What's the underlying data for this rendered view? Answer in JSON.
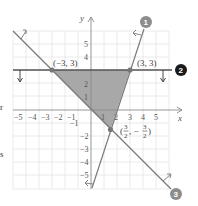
{
  "figure": {
    "type": "system-of-linear-inequalities-graph",
    "axes": {
      "x_label": "x",
      "y_label": "y",
      "x_ticks": [
        "−5",
        "−4",
        "−3",
        "−2",
        "−1",
        "1",
        "2",
        "3",
        "4",
        "5"
      ],
      "y_ticks_pos": [
        "1",
        "2",
        "4",
        "5"
      ],
      "y_ticks_neg": [
        "−1",
        "−2",
        "−3",
        "−4",
        "−5"
      ],
      "range": {
        "xmin": -6,
        "xmax": 6,
        "ymin": -6,
        "ymax": 6
      }
    },
    "lines": [
      {
        "id": "1",
        "badge": "1",
        "badge_style": "gray",
        "through": [
          [
            0,
            -6
          ],
          [
            3,
            3
          ]
        ],
        "shade_arrow": "up-left"
      },
      {
        "id": "2",
        "badge": "2",
        "badge_style": "black",
        "equation_form": "y = 3",
        "shade_arrow": "down"
      },
      {
        "id": "3",
        "badge": "3",
        "badge_style": "gray",
        "equation_form": "y = -x",
        "shade_arrow": "up-right"
      }
    ],
    "vertices": [
      {
        "label": "(−3, 3)",
        "x": -3,
        "y": 3
      },
      {
        "label": "(3, 3)",
        "x": 3,
        "y": 3
      },
      {
        "label_left": "(",
        "num_x": "3",
        "den_x": "2",
        "sep": ", −",
        "num_y": "3",
        "den_y": "2",
        "label_right": ")",
        "x": 1.5,
        "y": -1.5
      }
    ],
    "feasible_region": {
      "vertices": [
        [
          -3,
          3
        ],
        [
          3,
          3
        ],
        [
          1.5,
          -1.5
        ],
        [
          0,
          0
        ]
      ],
      "fill": "#9a9a9a"
    },
    "colors": {
      "grid": "#e2e2e2",
      "axis": "#8a8a8a",
      "line": "#7a7a7a",
      "line2": "#555555",
      "badge_gray": "#8c8c8c",
      "badge_black": "#1a1a1a",
      "shade": "#a3a3a3"
    }
  },
  "edge_text": {
    "left_top": "r",
    "left_bottom": "s"
  }
}
